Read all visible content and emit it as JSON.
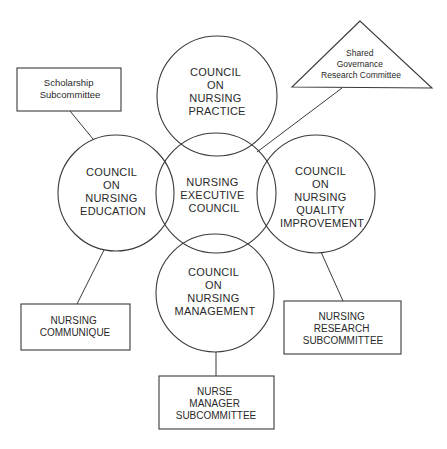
{
  "diagram": {
    "colors": {
      "stroke": "#3a3a3a",
      "text": "#2a2a2a",
      "background": "#ffffff"
    },
    "councils": {
      "practice": {
        "lines": [
          "COUNCIL",
          "ON",
          "NURSING",
          "PRACTICE"
        ]
      },
      "education": {
        "lines": [
          "COUNCIL",
          "ON",
          "NURSING",
          "EDUCATION"
        ]
      },
      "executive": {
        "lines": [
          "NURSING",
          "EXECUTIVE",
          "COUNCIL"
        ]
      },
      "quality": {
        "lines": [
          "COUNCIL",
          "ON",
          "NURSING",
          "QUALITY",
          "IMPROVEMENT"
        ]
      },
      "management": {
        "lines": [
          "COUNCIL",
          "ON",
          "NURSING",
          "MANAGEMENT"
        ]
      }
    },
    "committees": {
      "scholarship": {
        "lines": [
          "Scholarship",
          "Subcommittee"
        ]
      },
      "shared_governance": {
        "lines": [
          "Shared",
          "Governance",
          "Research Committee"
        ]
      },
      "communique": {
        "lines": [
          "NURSING",
          "COMMUNIQUE"
        ]
      },
      "research": {
        "lines": [
          "NURSING",
          "RESEARCH",
          "SUBCOMMITTEE"
        ]
      },
      "nurse_manager": {
        "lines": [
          "NURSE",
          "MANAGER",
          "SUBCOMMITTEE"
        ]
      }
    }
  }
}
